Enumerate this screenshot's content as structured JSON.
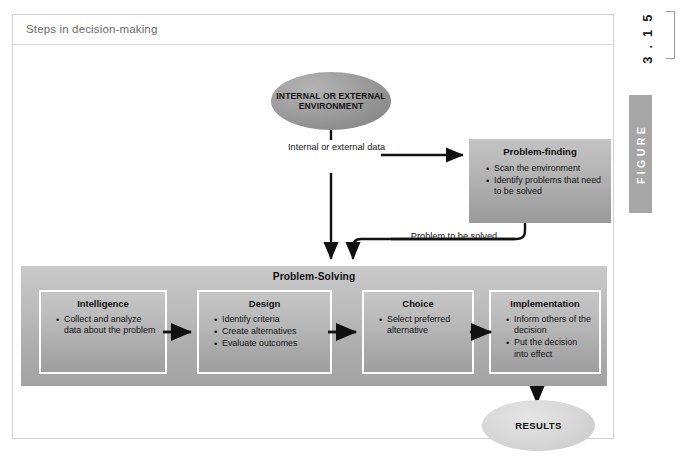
{
  "figure": {
    "title": "Steps in decision-making",
    "number": "3 . 1 5",
    "word": "FIGURE"
  },
  "diagram": {
    "environment_node": "INTERNAL OR EXTERNAL ENVIRONMENT",
    "data_edge_label": "Internal or external data",
    "problem_edge_label": "Problem to be solved",
    "problem_finding": {
      "title": "Problem-finding",
      "bullets": [
        "Scan the environment",
        "Identify problems that need to be solved"
      ]
    },
    "problem_solving": {
      "title": "Problem-Solving",
      "stages": [
        {
          "title": "Intelligence",
          "bullets": [
            "Collect and analyze data about the problem"
          ]
        },
        {
          "title": "Design",
          "bullets": [
            "Identify criteria",
            "Create alternatives",
            "Evaluate outcomes"
          ]
        },
        {
          "title": "Choice",
          "bullets": [
            "Select preferred alternative"
          ]
        },
        {
          "title": "Implementation",
          "bullets": [
            "Inform others of the decision",
            "Put the decision into effect"
          ]
        }
      ]
    },
    "results_node": "RESULTS"
  },
  "colors": {
    "frame_border": "#d2d2d2",
    "title_text": "#6a6a6a",
    "banner_gray": "#b9b9b9",
    "figure_label_gray": "#a6a6a6",
    "results_gray": "#d8d8d8",
    "arrow_black": "#111111"
  }
}
